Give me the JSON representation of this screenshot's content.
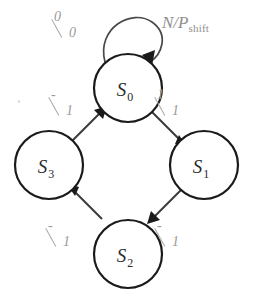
{
  "figure": {
    "type": "state-transition-diagram",
    "title": "",
    "background_color": "#ffffff",
    "node_stroke_color": "#1a1a1a",
    "edge_color": "#3a3a3a",
    "label_color": "#9a9a9a"
  },
  "states": [
    {
      "id": "S0",
      "name": "S",
      "subscript": "0",
      "cx": 128,
      "cy": 88,
      "r": 34
    },
    {
      "id": "S1",
      "name": "S",
      "subscript": "1",
      "cx": 204,
      "cy": 165,
      "r": 34
    },
    {
      "id": "S2",
      "name": "S",
      "subscript": "2",
      "cx": 128,
      "cy": 254,
      "r": 34
    },
    {
      "id": "S3",
      "name": "S",
      "subscript": "3",
      "cx": 49,
      "cy": 165,
      "r": 34
    }
  ],
  "transitions": [
    {
      "id": "t-self-s0",
      "from": "S0",
      "to": "S0",
      "kind": "self-loop",
      "label_numerator": "0",
      "label_denominator": "0",
      "label_text": "0/0",
      "label_x": 54,
      "label_y": 10
    },
    {
      "id": "t-s0-s1",
      "from": "S0",
      "to": "S1",
      "kind": "edge",
      "label_numerator": "1",
      "label_denominator": "1",
      "label_text": "1/1",
      "label_x": 157,
      "label_y": 88
    },
    {
      "id": "t-s1-s2",
      "from": "S1",
      "to": "S2",
      "kind": "edge",
      "label_numerator": "-",
      "label_denominator": "1",
      "label_text": "-/1",
      "label_x": 157,
      "label_y": 219
    },
    {
      "id": "t-s2-s3",
      "from": "S2",
      "to": "S3",
      "kind": "edge",
      "label_numerator": "-",
      "label_denominator": "1",
      "label_text": "-/1",
      "label_x": 48,
      "label_y": 219
    },
    {
      "id": "t-s3-s0",
      "from": "S3",
      "to": "S0",
      "kind": "edge",
      "label_numerator": "-",
      "label_denominator": "1",
      "label_text": "-/1",
      "label_x": 51,
      "label_y": 88
    }
  ],
  "annotations": [
    {
      "id": "np-shift",
      "text": "N/P",
      "subscript": "shift",
      "x": 162,
      "y": 14
    }
  ]
}
